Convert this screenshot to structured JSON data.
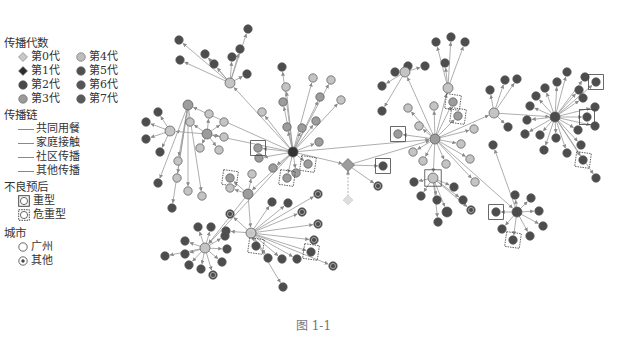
{
  "legend": {
    "generation_title": "传播代数",
    "generations": [
      {
        "label": "第0代",
        "color": "#c8c8c8",
        "shape": "diamond"
      },
      {
        "label": "第4代",
        "color": "#bdbdbd",
        "shape": "circle"
      },
      {
        "label": "第1代",
        "color": "#2e2e2e",
        "shape": "diamond"
      },
      {
        "label": "第5代",
        "color": "#505050",
        "shape": "circle"
      },
      {
        "label": "第2代",
        "color": "#4a4a4a",
        "shape": "circle"
      },
      {
        "label": "第6代",
        "color": "#555555",
        "shape": "circle"
      },
      {
        "label": "第3代",
        "color": "#9a9a9a",
        "shape": "circle"
      },
      {
        "label": "第7代",
        "color": "#5a5a5a",
        "shape": "circle"
      }
    ],
    "chain_title": "传播链",
    "chains": [
      {
        "label": "共同用餐"
      },
      {
        "label": "家庭接触"
      },
      {
        "label": "社区传播"
      },
      {
        "label": "其他传播"
      }
    ],
    "prognosis_title": "不良预后",
    "prognosis": [
      {
        "label": "重型",
        "marker": "square"
      },
      {
        "label": "危重型",
        "marker": "dashed-square"
      }
    ],
    "city_title": "城市",
    "cities": [
      {
        "label": "广州",
        "marker": "ring"
      },
      {
        "label": "其他",
        "marker": "dot-ring"
      }
    ]
  },
  "caption": "图 1-1",
  "colors": {
    "edge": "#999999",
    "light": "#c4c4c4",
    "mid": "#9c9c9c",
    "dark": "#4d4d4d",
    "darker": "#333333"
  },
  "graph": {
    "hubs": [
      {
        "id": "A",
        "x": 293,
        "y": 152,
        "c": "darker",
        "r": 5
      },
      {
        "id": "B",
        "x": 435,
        "y": 139,
        "c": "mid",
        "r": 5
      },
      {
        "id": "C",
        "x": 555,
        "y": 117,
        "c": "dark",
        "r": 5
      },
      {
        "id": "D",
        "x": 251,
        "y": 233,
        "c": "light",
        "r": 5,
        "ring": true
      },
      {
        "id": "E",
        "x": 205,
        "y": 248,
        "c": "light",
        "r": 5
      },
      {
        "id": "F",
        "x": 348,
        "y": 165,
        "c": "mid",
        "r": 5,
        "diamond": true
      },
      {
        "id": "G",
        "x": 188,
        "y": 105,
        "c": "mid",
        "r": 5
      },
      {
        "id": "H",
        "x": 248,
        "y": 194,
        "c": "mid",
        "r": 5
      },
      {
        "id": "I",
        "x": 207,
        "y": 134,
        "c": "mid",
        "r": 5
      },
      {
        "id": "J",
        "x": 170,
        "y": 131,
        "c": "light",
        "r": 5
      },
      {
        "id": "K",
        "x": 230,
        "y": 83,
        "c": "light",
        "r": 5
      },
      {
        "id": "L",
        "x": 447,
        "y": 212,
        "c": "dark",
        "r": 5
      },
      {
        "id": "M",
        "x": 494,
        "y": 113,
        "c": "light",
        "r": 5
      },
      {
        "id": "N",
        "x": 433,
        "y": 178,
        "c": "light",
        "r": 5,
        "sq": true
      },
      {
        "id": "O",
        "x": 517,
        "y": 212,
        "c": "dark",
        "r": 5
      },
      {
        "id": "P",
        "x": 405,
        "y": 72,
        "c": "light",
        "r": 5
      },
      {
        "id": "Q",
        "x": 448,
        "y": 88,
        "c": "light",
        "r": 5
      }
    ],
    "edges": [
      [
        "A",
        "B"
      ],
      [
        "A",
        "G"
      ],
      [
        "A",
        "I"
      ],
      [
        "A",
        "K"
      ],
      [
        "A",
        "H"
      ],
      [
        "A",
        "F"
      ],
      [
        "A",
        "E"
      ],
      [
        "B",
        "M"
      ],
      [
        "M",
        "C"
      ],
      [
        "B",
        "N"
      ],
      [
        "B",
        "P"
      ],
      [
        "B",
        "Q"
      ],
      [
        "B",
        "O"
      ],
      [
        "H",
        "D"
      ],
      [
        "H",
        "E"
      ],
      [
        "F",
        "B"
      ],
      [
        "I",
        "J"
      ],
      [
        "N",
        "L"
      ]
    ],
    "leaves": [
      {
        "p": "A",
        "x": 283,
        "y": 102,
        "c": "mid"
      },
      {
        "p": "A",
        "x": 262,
        "y": 112,
        "c": "light"
      },
      {
        "p": "A",
        "x": 287,
        "y": 127,
        "c": "mid"
      },
      {
        "p": "A",
        "x": 302,
        "y": 128,
        "c": "mid"
      },
      {
        "p": "A",
        "x": 316,
        "y": 121,
        "c": "mid"
      },
      {
        "p": "A",
        "x": 319,
        "y": 142,
        "c": "mid"
      },
      {
        "p": "A",
        "x": 259,
        "y": 158,
        "c": "mid"
      },
      {
        "p": "A",
        "x": 273,
        "y": 168,
        "c": "mid"
      },
      {
        "p": "A",
        "x": 296,
        "y": 173,
        "c": "mid"
      },
      {
        "p": "A",
        "x": 308,
        "y": 164,
        "c": "mid",
        "dsq": true
      },
      {
        "p": "A",
        "x": 287,
        "y": 178,
        "c": "mid",
        "dsq": true
      },
      {
        "p": "A",
        "x": 258,
        "y": 148,
        "c": "mid",
        "sq": true
      },
      {
        "p": "A",
        "x": 286,
        "y": 87,
        "c": "light"
      },
      {
        "p": "A",
        "x": 320,
        "y": 97,
        "c": "mid"
      },
      {
        "p": "A",
        "x": 313,
        "y": 78,
        "c": "light"
      },
      {
        "p": "A",
        "x": 331,
        "y": 80,
        "c": "light"
      },
      {
        "p": "A",
        "x": 341,
        "y": 100,
        "c": "light"
      },
      {
        "p": "A",
        "x": 282,
        "y": 67,
        "c": "dark"
      },
      {
        "p": "K",
        "x": 247,
        "y": 74,
        "c": "dark"
      },
      {
        "p": "K",
        "x": 232,
        "y": 57,
        "c": "dark"
      },
      {
        "p": "K",
        "x": 240,
        "y": 49,
        "c": "dark"
      },
      {
        "p": "K",
        "x": 214,
        "y": 64,
        "c": "dark"
      },
      {
        "p": "K",
        "x": 205,
        "y": 54,
        "c": "dark"
      },
      {
        "p": "K",
        "x": 179,
        "y": 40,
        "c": "dark"
      },
      {
        "p": "K",
        "x": 180,
        "y": 60,
        "c": "dark"
      },
      {
        "p": "K",
        "x": 248,
        "y": 29,
        "c": "dark"
      },
      {
        "p": "I",
        "x": 209,
        "y": 114,
        "c": "light"
      },
      {
        "p": "I",
        "x": 224,
        "y": 122,
        "c": "light"
      },
      {
        "p": "I",
        "x": 190,
        "y": 122,
        "c": "light"
      },
      {
        "p": "I",
        "x": 200,
        "y": 148,
        "c": "light"
      },
      {
        "p": "I",
        "x": 219,
        "y": 150,
        "c": "light"
      },
      {
        "p": "I",
        "x": 224,
        "y": 137,
        "c": "light"
      },
      {
        "p": "J",
        "x": 158,
        "y": 112,
        "c": "dark"
      },
      {
        "p": "J",
        "x": 146,
        "y": 122,
        "c": "dark"
      },
      {
        "p": "J",
        "x": 146,
        "y": 139,
        "c": "dark"
      },
      {
        "p": "J",
        "x": 160,
        "y": 152,
        "c": "dark"
      },
      {
        "p": "G",
        "x": 178,
        "y": 161,
        "c": "light"
      },
      {
        "p": "G",
        "x": 177,
        "y": 178,
        "c": "light"
      },
      {
        "p": "G",
        "x": 158,
        "y": 183,
        "c": "dark"
      },
      {
        "p": "G",
        "x": 188,
        "y": 191,
        "c": "light"
      },
      {
        "p": "G",
        "x": 202,
        "y": 196,
        "c": "light"
      },
      {
        "p": "G",
        "x": 172,
        "y": 208,
        "c": "dark"
      },
      {
        "p": "H",
        "x": 230,
        "y": 178,
        "c": "mid",
        "dsq": true
      },
      {
        "p": "H",
        "x": 252,
        "y": 174,
        "c": "light"
      },
      {
        "p": "H",
        "x": 230,
        "y": 188,
        "c": "light"
      },
      {
        "p": "D",
        "x": 272,
        "y": 202,
        "c": "dark"
      },
      {
        "p": "D",
        "x": 288,
        "y": 203,
        "c": "dark"
      },
      {
        "p": "D",
        "x": 302,
        "y": 212,
        "c": "dark",
        "ring": true
      },
      {
        "p": "D",
        "x": 318,
        "y": 194,
        "c": "dark",
        "ring": true
      },
      {
        "p": "D",
        "x": 230,
        "y": 214,
        "c": "dark",
        "ring": true
      },
      {
        "p": "D",
        "x": 226,
        "y": 231,
        "c": "dark"
      },
      {
        "p": "D",
        "x": 318,
        "y": 224,
        "c": "dark",
        "ring": true
      },
      {
        "p": "D",
        "x": 314,
        "y": 240,
        "c": "dark",
        "ring": true
      },
      {
        "p": "D",
        "x": 311,
        "y": 252,
        "c": "dark",
        "dsq": true
      },
      {
        "p": "D",
        "x": 256,
        "y": 246,
        "c": "dark",
        "dsq": true
      },
      {
        "p": "D",
        "x": 268,
        "y": 258,
        "c": "dark"
      },
      {
        "p": "D",
        "x": 282,
        "y": 259,
        "c": "dark"
      },
      {
        "p": "D",
        "x": 283,
        "y": 287,
        "c": "dark"
      },
      {
        "p": "D",
        "x": 333,
        "y": 266,
        "c": "dark",
        "ring": true
      },
      {
        "p": "D",
        "x": 297,
        "y": 259,
        "c": "dark"
      },
      {
        "p": "E",
        "x": 198,
        "y": 227,
        "c": "dark"
      },
      {
        "p": "E",
        "x": 211,
        "y": 227,
        "c": "dark"
      },
      {
        "p": "E",
        "x": 225,
        "y": 236,
        "c": "dark"
      },
      {
        "p": "E",
        "x": 185,
        "y": 241,
        "c": "dark"
      },
      {
        "p": "E",
        "x": 227,
        "y": 249,
        "c": "dark"
      },
      {
        "p": "E",
        "x": 165,
        "y": 256,
        "c": "dark"
      },
      {
        "p": "E",
        "x": 185,
        "y": 254,
        "c": "dark"
      },
      {
        "p": "E",
        "x": 189,
        "y": 265,
        "c": "dark"
      },
      {
        "p": "E",
        "x": 201,
        "y": 269,
        "c": "dark"
      },
      {
        "p": "E",
        "x": 222,
        "y": 262,
        "c": "dark"
      },
      {
        "p": "E",
        "x": 213,
        "y": 275,
        "c": "dark",
        "ring": true
      },
      {
        "p": "F",
        "x": 383,
        "y": 166,
        "c": "dark",
        "sq": true
      },
      {
        "p": "F",
        "x": 378,
        "y": 186,
        "c": "dark",
        "ring": true
      },
      {
        "p": "B",
        "x": 408,
        "y": 108,
        "c": "light"
      },
      {
        "p": "B",
        "x": 419,
        "y": 126,
        "c": "light"
      },
      {
        "p": "B",
        "x": 398,
        "y": 134,
        "c": "mid",
        "sq": true
      },
      {
        "p": "B",
        "x": 434,
        "y": 106,
        "c": "light"
      },
      {
        "p": "B",
        "x": 453,
        "y": 102,
        "c": "mid",
        "dsq": true
      },
      {
        "p": "B",
        "x": 458,
        "y": 116,
        "c": "mid",
        "dsq": true
      },
      {
        "p": "B",
        "x": 474,
        "y": 129,
        "c": "light"
      },
      {
        "p": "B",
        "x": 461,
        "y": 144,
        "c": "light"
      },
      {
        "p": "B",
        "x": 413,
        "y": 152,
        "c": "light"
      },
      {
        "p": "B",
        "x": 423,
        "y": 161,
        "c": "light"
      },
      {
        "p": "B",
        "x": 446,
        "y": 164,
        "c": "light"
      },
      {
        "p": "B",
        "x": 470,
        "y": 159,
        "c": "light"
      },
      {
        "p": "B",
        "x": 475,
        "y": 182,
        "c": "light"
      },
      {
        "p": "O",
        "x": 493,
        "y": 145,
        "c": "dark"
      },
      {
        "p": "P",
        "x": 382,
        "y": 86,
        "c": "dark"
      },
      {
        "p": "P",
        "x": 395,
        "y": 72,
        "c": "dark"
      },
      {
        "p": "P",
        "x": 382,
        "y": 111,
        "c": "dark"
      },
      {
        "p": "P",
        "x": 408,
        "y": 66,
        "c": "dark"
      },
      {
        "p": "P",
        "x": 425,
        "y": 66,
        "c": "dark"
      },
      {
        "p": "Q",
        "x": 445,
        "y": 63,
        "c": "dark"
      },
      {
        "p": "Q",
        "x": 436,
        "y": 42,
        "c": "dark"
      },
      {
        "p": "Q",
        "x": 451,
        "y": 37,
        "c": "dark"
      },
      {
        "p": "Q",
        "x": 465,
        "y": 42,
        "c": "dark"
      },
      {
        "p": "M",
        "x": 490,
        "y": 90,
        "c": "dark"
      },
      {
        "p": "M",
        "x": 505,
        "y": 80,
        "c": "dark"
      },
      {
        "p": "M",
        "x": 517,
        "y": 79,
        "c": "dark"
      },
      {
        "p": "M",
        "x": 508,
        "y": 127,
        "c": "dark"
      },
      {
        "p": "N",
        "x": 414,
        "y": 182,
        "c": "dark"
      },
      {
        "p": "N",
        "x": 421,
        "y": 196,
        "c": "dark"
      },
      {
        "p": "N",
        "x": 437,
        "y": 200,
        "c": "dark"
      },
      {
        "p": "N",
        "x": 438,
        "y": 222,
        "c": "dark"
      },
      {
        "p": "N",
        "x": 454,
        "y": 187,
        "c": "dark"
      },
      {
        "p": "N",
        "x": 463,
        "y": 200,
        "c": "dark"
      },
      {
        "p": "N",
        "x": 471,
        "y": 210,
        "c": "dark",
        "ring": true
      },
      {
        "p": "O",
        "x": 515,
        "y": 195,
        "c": "dark"
      },
      {
        "p": "O",
        "x": 531,
        "y": 198,
        "c": "dark"
      },
      {
        "p": "O",
        "x": 539,
        "y": 211,
        "c": "dark"
      },
      {
        "p": "O",
        "x": 543,
        "y": 226,
        "c": "dark"
      },
      {
        "p": "O",
        "x": 530,
        "y": 236,
        "c": "dark"
      },
      {
        "p": "O",
        "x": 513,
        "y": 240,
        "c": "dark",
        "dsq": true
      },
      {
        "p": "O",
        "x": 502,
        "y": 229,
        "c": "dark"
      },
      {
        "p": "O",
        "x": 496,
        "y": 212,
        "c": "dark",
        "sq": true
      },
      {
        "p": "C",
        "x": 567,
        "y": 72,
        "c": "dark"
      },
      {
        "p": "C",
        "x": 557,
        "y": 82,
        "c": "dark"
      },
      {
        "p": "C",
        "x": 545,
        "y": 88,
        "c": "dark"
      },
      {
        "p": "C",
        "x": 536,
        "y": 96,
        "c": "dark"
      },
      {
        "p": "C",
        "x": 530,
        "y": 106,
        "c": "dark"
      },
      {
        "p": "C",
        "x": 527,
        "y": 120,
        "c": "dark"
      },
      {
        "p": "C",
        "x": 525,
        "y": 134,
        "c": "dark"
      },
      {
        "p": "C",
        "x": 540,
        "y": 135,
        "c": "dark"
      },
      {
        "p": "C",
        "x": 556,
        "y": 138,
        "c": "dark"
      },
      {
        "p": "C",
        "x": 544,
        "y": 150,
        "c": "dark"
      },
      {
        "p": "C",
        "x": 567,
        "y": 153,
        "c": "dark"
      },
      {
        "p": "C",
        "x": 579,
        "y": 90,
        "c": "dark"
      },
      {
        "p": "C",
        "x": 585,
        "y": 77,
        "c": "dark"
      },
      {
        "p": "C",
        "x": 596,
        "y": 82,
        "c": "dark",
        "sq": true
      },
      {
        "p": "C",
        "x": 583,
        "y": 98,
        "c": "dark"
      },
      {
        "p": "C",
        "x": 595,
        "y": 107,
        "c": "dark"
      },
      {
        "p": "C",
        "x": 587,
        "y": 117,
        "c": "dark",
        "sq": true
      },
      {
        "p": "C",
        "x": 595,
        "y": 126,
        "c": "dark"
      },
      {
        "p": "C",
        "x": 578,
        "y": 130,
        "c": "dark"
      },
      {
        "p": "C",
        "x": 581,
        "y": 145,
        "c": "dark"
      },
      {
        "p": "C",
        "x": 583,
        "y": 160,
        "c": "dark",
        "dsq": true
      },
      {
        "p": "C",
        "x": 596,
        "y": 178,
        "c": "dark"
      }
    ],
    "index_case": {
      "x": 348,
      "y": 200
    }
  }
}
